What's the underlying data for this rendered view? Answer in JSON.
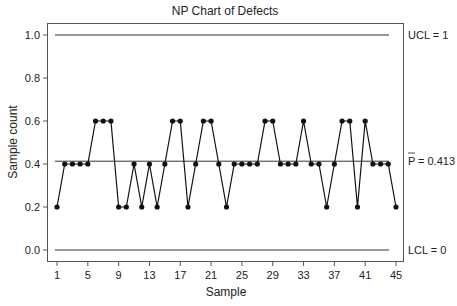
{
  "chart_data": {
    "type": "line",
    "title": "NP Chart of Defects",
    "xlabel": "Sample",
    "ylabel": "Sample count",
    "x": [
      1,
      2,
      3,
      4,
      5,
      6,
      7,
      8,
      9,
      10,
      11,
      12,
      13,
      14,
      15,
      16,
      17,
      18,
      19,
      20,
      21,
      22,
      23,
      24,
      25,
      26,
      27,
      28,
      29,
      30,
      31,
      32,
      33,
      34,
      35,
      36,
      37,
      38,
      39,
      40,
      41,
      42,
      43,
      44,
      45
    ],
    "series": [
      {
        "name": "Sample count",
        "values": [
          0.2,
          0.4,
          0.4,
          0.4,
          0.4,
          0.6,
          0.6,
          0.6,
          0.2,
          0.2,
          0.4,
          0.2,
          0.4,
          0.2,
          0.4,
          0.6,
          0.6,
          0.2,
          0.4,
          0.6,
          0.6,
          0.4,
          0.2,
          0.4,
          0.4,
          0.4,
          0.4,
          0.6,
          0.6,
          0.4,
          0.4,
          0.4,
          0.6,
          0.4,
          0.4,
          0.2,
          0.4,
          0.6,
          0.6,
          0.2,
          0.6,
          0.4,
          0.4,
          0.4,
          0.2
        ]
      }
    ],
    "xticks": [
      1,
      5,
      9,
      13,
      17,
      21,
      25,
      29,
      33,
      37,
      41,
      45
    ],
    "yticks": [
      0.0,
      0.2,
      0.4,
      0.6,
      0.8,
      1.0
    ],
    "ytick_labels": [
      "0.0",
      "0.2",
      "0.4",
      "0.6",
      "0.8",
      "1.0"
    ],
    "xlim": [
      1,
      45
    ],
    "ylim": [
      0.0,
      1.0
    ],
    "grid": false,
    "control_limits": {
      "ucl": {
        "value": 1,
        "label": "UCL = 1"
      },
      "center": {
        "value": 0.413,
        "label_symbol": "P",
        "label_value": "= 0.413"
      },
      "lcl": {
        "value": 0,
        "label": "LCL = 0"
      }
    },
    "colors": {
      "line": "#111111",
      "limit": "#333333",
      "frame": "#555555"
    }
  }
}
